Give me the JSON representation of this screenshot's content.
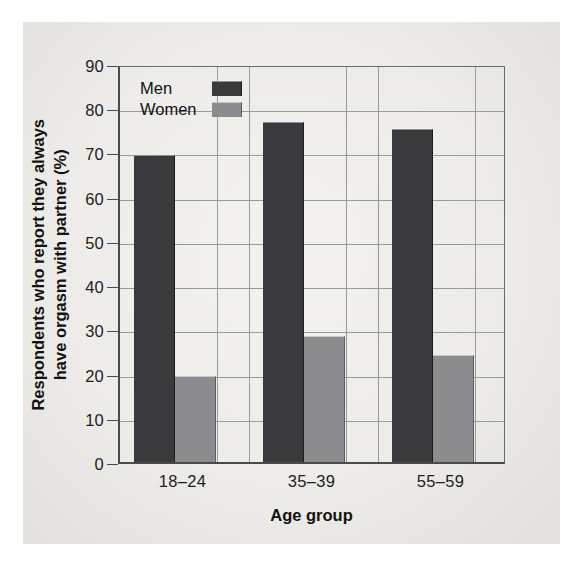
{
  "chart_data": {
    "type": "bar",
    "title": "",
    "xlabel": "Age group",
    "ylabel_line1": "Respondents who report they always",
    "ylabel_line2": "have orgasm with partner (%)",
    "categories": [
      "18–24",
      "35–39",
      "55–59"
    ],
    "series": [
      {
        "name": "Men",
        "values": [
          69.5,
          77,
          75.3
        ],
        "color": "#3a3a3c"
      },
      {
        "name": "Women",
        "values": [
          19.5,
          28.6,
          24.2
        ],
        "color": "#8c8c8e"
      }
    ],
    "ylim": [
      0,
      90
    ],
    "ytick_labels": [
      "0",
      "10",
      "20",
      "30",
      "40",
      "50",
      "60",
      "70",
      "80",
      "90"
    ],
    "ytick_values": [
      0,
      10,
      20,
      30,
      40,
      50,
      60,
      70,
      80,
      90
    ],
    "grid": "horizontal-and-vertical-category-separators",
    "legend_position": "top-left-inside",
    "background_color": "#f1efeb"
  }
}
